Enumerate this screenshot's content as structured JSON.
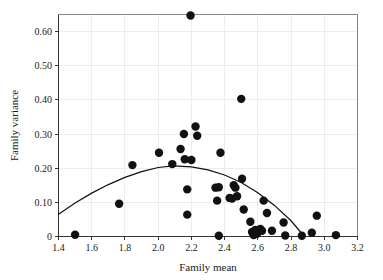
{
  "chart_data": {
    "type": "scatter",
    "title": "",
    "subtitle": "",
    "xlabel": "Family mean",
    "ylabel": "Family variance",
    "xlim": [
      1.4,
      3.2
    ],
    "ylim": [
      0,
      0.65
    ],
    "xticks": [
      1.4,
      1.6,
      1.8,
      2.0,
      2.2,
      2.4,
      2.6,
      2.8,
      3.0,
      3.2
    ],
    "xticklabels": [
      "1.4",
      "1.6",
      "1.8",
      "2.0",
      "2.2",
      "2.4",
      "2.6",
      "2.8",
      "3.0",
      "3.2"
    ],
    "yticks": [
      0,
      0.1,
      0.2,
      0.3,
      0.4,
      0.5,
      0.6
    ],
    "yticklabels": [
      "0",
      "0.10",
      "0.20",
      "0.30",
      "0.40",
      "0.50",
      "0.60"
    ],
    "grid": true,
    "grid_axis": "both",
    "legend": null,
    "legend_position": "none",
    "marker": "filled-circle",
    "marker_color": "#111111",
    "marker_size": 4.2,
    "points": [
      [
        1.5,
        0.005
      ],
      [
        1.765,
        0.096
      ],
      [
        1.845,
        0.209
      ],
      [
        2.005,
        0.245
      ],
      [
        2.085,
        0.212
      ],
      [
        2.135,
        0.256
      ],
      [
        2.155,
        0.3
      ],
      [
        2.16,
        0.226
      ],
      [
        2.175,
        0.138
      ],
      [
        2.175,
        0.064
      ],
      [
        2.195,
        0.647
      ],
      [
        2.2,
        0.224
      ],
      [
        2.225,
        0.322
      ],
      [
        2.235,
        0.295
      ],
      [
        2.345,
        0.143
      ],
      [
        2.355,
        0.105
      ],
      [
        2.365,
        0.144
      ],
      [
        2.365,
        0.002
      ],
      [
        2.375,
        0.245
      ],
      [
        2.43,
        0.113
      ],
      [
        2.445,
        0.111
      ],
      [
        2.455,
        0.15
      ],
      [
        2.465,
        0.143
      ],
      [
        2.475,
        0.118
      ],
      [
        2.5,
        0.403
      ],
      [
        2.505,
        0.169
      ],
      [
        2.515,
        0.079
      ],
      [
        2.555,
        0.043
      ],
      [
        2.565,
        0.013
      ],
      [
        2.575,
        0.004
      ],
      [
        2.585,
        0.019
      ],
      [
        2.595,
        0.008
      ],
      [
        2.615,
        0.022
      ],
      [
        2.625,
        0.017
      ],
      [
        2.635,
        0.105
      ],
      [
        2.655,
        0.069
      ],
      [
        2.685,
        0.017
      ],
      [
        2.755,
        0.041
      ],
      [
        2.765,
        0.003
      ],
      [
        2.865,
        0.002
      ],
      [
        2.925,
        0.011
      ],
      [
        2.955,
        0.061
      ],
      [
        3.07,
        0.004
      ]
    ],
    "fit": {
      "label": "",
      "type": "quadratic-fit-curve",
      "color": "#111111",
      "x_start": 1.4,
      "x_end": 2.88,
      "vertex_x": 2.09,
      "vertex_y": 0.207,
      "y_at_x_start": 0.065,
      "y_at_x_end": 0.0,
      "samples": [
        [
          1.4,
          0.065
        ],
        [
          1.5,
          0.098
        ],
        [
          1.6,
          0.127
        ],
        [
          1.7,
          0.152
        ],
        [
          1.8,
          0.173
        ],
        [
          1.9,
          0.19
        ],
        [
          2.0,
          0.202
        ],
        [
          2.09,
          0.207
        ],
        [
          2.2,
          0.204
        ],
        [
          2.3,
          0.195
        ],
        [
          2.4,
          0.18
        ],
        [
          2.5,
          0.158
        ],
        [
          2.6,
          0.128
        ],
        [
          2.7,
          0.091
        ],
        [
          2.8,
          0.046
        ],
        [
          2.88,
          0.0
        ]
      ]
    }
  },
  "figure": {
    "background_color": "#ffffff",
    "frame_color": "#888888",
    "grid_color": "#e8e8e8",
    "text_color": "#1a1a1a"
  }
}
